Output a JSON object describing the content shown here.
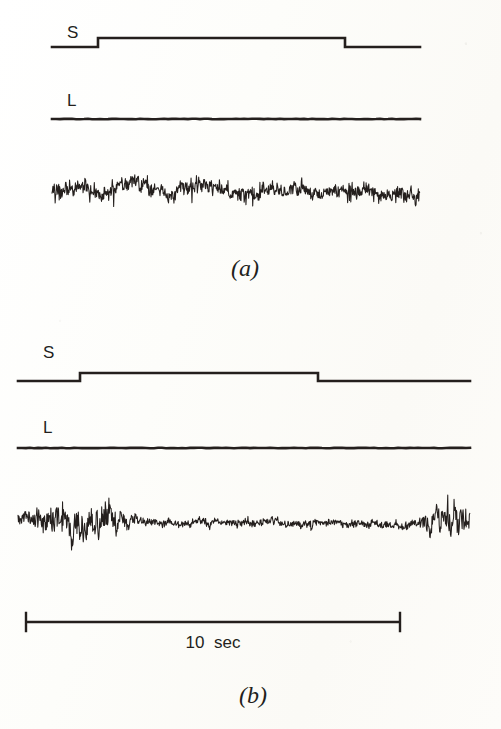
{
  "figure": {
    "kind": "electrophysiology-recording-figure",
    "background_color": "#fdfdfa",
    "ink_color": "#241f1d",
    "width": 501,
    "height": 729
  },
  "panels": [
    {
      "id": "a",
      "caption": "(a)",
      "channels": [
        {
          "id": "S",
          "label": "S",
          "type": "step-marker"
        },
        {
          "id": "L",
          "label": "L",
          "type": "flat-marker"
        },
        {
          "id": "EMG",
          "label": "",
          "type": "noise-trace"
        }
      ]
    },
    {
      "id": "b",
      "caption": "(b)",
      "channels": [
        {
          "id": "S",
          "label": "S",
          "type": "step-marker"
        },
        {
          "id": "L",
          "label": "L",
          "type": "flat-marker"
        },
        {
          "id": "EMG",
          "label": "",
          "type": "noise-trace"
        }
      ]
    }
  ],
  "scalebar": {
    "label": "10  sec",
    "value": 10,
    "unit": "sec"
  },
  "chart_data": {
    "type": "line",
    "title": "",
    "xlabel": "",
    "ylabel": "",
    "legend": [],
    "grid": false,
    "x_scale_bar": {
      "length_label": "10  sec",
      "length_value": 10,
      "unit": "sec"
    },
    "panels": [
      {
        "panel": "a",
        "caption": "(a)",
        "traces": [
          {
            "name": "S",
            "label": "S",
            "type": "step",
            "description": "square step marker: low, rises, stays high, falls back to low",
            "x0": 52,
            "x1": 420,
            "y_low": 47,
            "y_high": 38,
            "step_up_x": 98,
            "step_down_x": 345
          },
          {
            "name": "L",
            "label": "L",
            "type": "flat",
            "description": "flat horizontal marker line",
            "x0": 52,
            "x1": 420,
            "y": 119
          },
          {
            "name": "EMG",
            "label": "",
            "type": "noise",
            "description": "dense high-amplitude EMG activity, sustained across whole sweep",
            "x0": 52,
            "x1": 420,
            "y_center": 192,
            "baseline_amplitude": 14,
            "seed": 1207,
            "envelope": [
              {
                "x": 0.0,
                "amp": 0.9
              },
              {
                "x": 0.06,
                "amp": 1.0
              },
              {
                "x": 0.14,
                "amp": 0.82
              },
              {
                "x": 0.22,
                "amp": 0.95
              },
              {
                "x": 0.3,
                "amp": 0.7
              },
              {
                "x": 0.36,
                "amp": 1.05
              },
              {
                "x": 0.44,
                "amp": 0.8
              },
              {
                "x": 0.52,
                "amp": 0.95
              },
              {
                "x": 0.6,
                "amp": 0.75
              },
              {
                "x": 0.68,
                "amp": 0.88
              },
              {
                "x": 0.74,
                "amp": 0.62
              },
              {
                "x": 0.82,
                "amp": 0.95
              },
              {
                "x": 0.9,
                "amp": 0.85
              },
              {
                "x": 1.0,
                "amp": 1.0
              }
            ]
          }
        ]
      },
      {
        "panel": "b",
        "caption": "(b)",
        "traces": [
          {
            "name": "S",
            "label": "S",
            "type": "step",
            "description": "square step marker: low, rises, stays high, falls back to low",
            "x0": 18,
            "x1": 470,
            "y_low": 381,
            "y_high": 373,
            "step_up_x": 80,
            "step_down_x": 318
          },
          {
            "name": "L",
            "label": "L",
            "type": "flat",
            "description": "flat horizontal marker line",
            "x0": 18,
            "x1": 470,
            "y": 448
          },
          {
            "name": "EMG",
            "label": "",
            "type": "noise",
            "description": "EMG with large bursts at onset and offset, quiet low-amplitude middle",
            "x0": 18,
            "x1": 470,
            "y_center": 523,
            "baseline_amplitude": 13,
            "seed": 4431,
            "envelope": [
              {
                "x": 0.0,
                "amp": 0.75
              },
              {
                "x": 0.04,
                "amp": 1.2
              },
              {
                "x": 0.1,
                "amp": 1.7
              },
              {
                "x": 0.15,
                "amp": 1.85
              },
              {
                "x": 0.2,
                "amp": 1.4
              },
              {
                "x": 0.25,
                "amp": 0.8
              },
              {
                "x": 0.3,
                "amp": 0.42
              },
              {
                "x": 0.4,
                "amp": 0.4
              },
              {
                "x": 0.5,
                "amp": 0.48
              },
              {
                "x": 0.6,
                "amp": 0.45
              },
              {
                "x": 0.7,
                "amp": 0.48
              },
              {
                "x": 0.8,
                "amp": 0.42
              },
              {
                "x": 0.88,
                "amp": 0.55
              },
              {
                "x": 0.92,
                "amp": 1.4
              },
              {
                "x": 0.96,
                "amp": 1.8
              },
              {
                "x": 1.0,
                "amp": 1.35
              }
            ]
          }
        ]
      }
    ]
  },
  "layout": {
    "panel_a": {
      "s_label": {
        "x": 67,
        "y": 24
      },
      "l_label": {
        "x": 67,
        "y": 92
      },
      "caption": {
        "x": 245,
        "y": 256
      }
    },
    "panel_b": {
      "s_label": {
        "x": 43,
        "y": 344
      },
      "l_label": {
        "x": 43,
        "y": 419
      },
      "caption": {
        "x": 253,
        "y": 683
      }
    },
    "scalebar": {
      "x0": 26,
      "x1": 400,
      "y": 622,
      "cap_half_height": 9,
      "label": {
        "x": 213,
        "y": 634
      }
    }
  }
}
